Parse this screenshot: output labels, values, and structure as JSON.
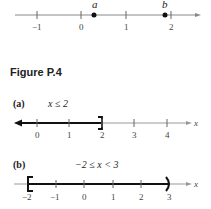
{
  "top_line": {
    "ticks": [
      "−1",
      "0",
      "1",
      "2"
    ],
    "points": [
      {
        "label": "a",
        "value": 0.3
      },
      {
        "label": "b",
        "value": 1.85
      }
    ]
  },
  "figure_label": "Figure P.4",
  "part_a": {
    "tag": "(a)",
    "inequality": "x ≤ 2",
    "ticks": [
      "0",
      "1",
      "2",
      "3",
      "4"
    ],
    "axis_label": "x"
  },
  "part_b": {
    "tag": "(b)",
    "inequality": "−2 ≤ x < 3",
    "ticks": [
      "−2",
      "−1",
      "0",
      "1",
      "2",
      "3"
    ],
    "axis_label": "x"
  }
}
